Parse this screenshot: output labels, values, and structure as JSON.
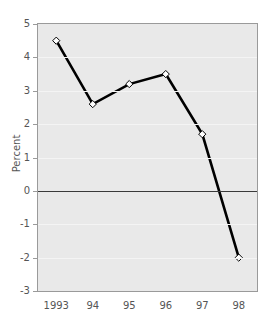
{
  "chart_data": {
    "type": "line",
    "title": "",
    "xlabel": "",
    "ylabel": "Percent",
    "categories": [
      "1993",
      "94",
      "95",
      "96",
      "97",
      "98"
    ],
    "values": [
      4.5,
      2.6,
      3.2,
      3.5,
      1.7,
      -2.0
    ],
    "series": [
      {
        "name": "Percent",
        "values": [
          4.5,
          2.6,
          3.2,
          3.5,
          1.7,
          -2.0
        ],
        "marker": "open-diamond",
        "line_color": "#000000",
        "marker_fill": "#ffffff"
      }
    ],
    "ylim": [
      -3,
      5
    ],
    "yticks": [
      5,
      4,
      3,
      2,
      1,
      0,
      -1,
      -2,
      -3
    ],
    "ytick_labels": [
      "5",
      "4",
      "3",
      "2",
      "1",
      "0",
      "-1",
      "-2",
      "-3"
    ],
    "grid": true,
    "zero_line": true,
    "legend": "none",
    "plot_background": "#e9e9e9",
    "grid_color": "#f4f4f4",
    "axis_color": "#9a9a9a"
  }
}
